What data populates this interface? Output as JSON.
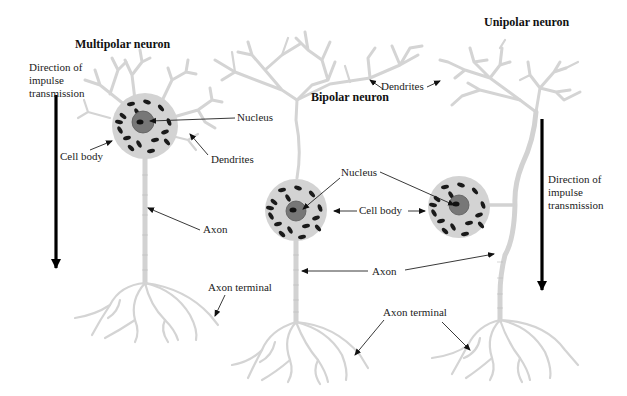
{
  "figure": {
    "type": "neuron-types-diagram",
    "colors": {
      "background": "#ffffff",
      "process": "#d4d4d4",
      "cell_body": "#d3d3d3",
      "nucleus": "#777777",
      "granules": "#1a1a1a",
      "text": "#222222",
      "arrow": "#000000"
    }
  },
  "multipolar": {
    "title": "Multipolar neuron",
    "direction_label": "Direction of impulse transmission",
    "labels": {
      "nucleus": "Nucleus",
      "cell_body": "Cell body",
      "dendrites": "Dendrites",
      "axon": "Axon",
      "axon_terminal": "Axon terminal"
    }
  },
  "bipolar": {
    "title": "Bipolar neuron",
    "labels": {
      "dendrites": "Dendrites",
      "nucleus": "Nucleus",
      "cell_body": "Cell body",
      "axon": "Axon",
      "axon_terminal": "Axon terminal"
    }
  },
  "unipolar": {
    "title": "Unipolar neuron",
    "direction_label": "Direction of impulse transmission"
  }
}
